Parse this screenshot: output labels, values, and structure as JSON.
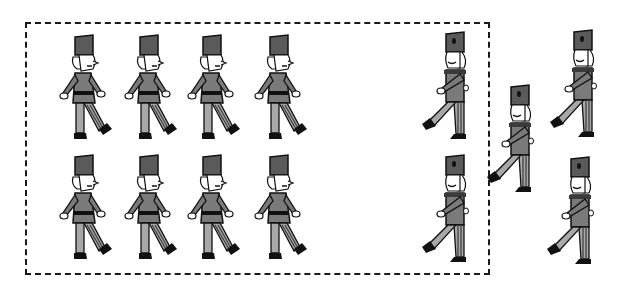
{
  "scene": {
    "description": "Toy soldiers marching; eight grouped inside a dashed rectangle facing right, two inside on the right facing left, three outside the box facing left",
    "colors": {
      "hat": "#5a5a5a",
      "coat": "#7a7a7a",
      "trousers": "#a8a8a8",
      "stripe": "#3a3a3a",
      "skin": "#ffffff",
      "outline": "#111111",
      "boot": "#111111"
    },
    "box": {
      "x": 25,
      "y": 22,
      "width": 465,
      "height": 253,
      "style": "dashed"
    },
    "soldiers": [
      {
        "id": "s1",
        "x": 57,
        "y": 33,
        "facing": "right",
        "in_box": true
      },
      {
        "id": "s2",
        "x": 122,
        "y": 33,
        "facing": "right",
        "in_box": true
      },
      {
        "id": "s3",
        "x": 185,
        "y": 33,
        "facing": "right",
        "in_box": true
      },
      {
        "id": "s4",
        "x": 252,
        "y": 33,
        "facing": "right",
        "in_box": true
      },
      {
        "id": "s5",
        "x": 57,
        "y": 153,
        "facing": "right",
        "in_box": true
      },
      {
        "id": "s6",
        "x": 122,
        "y": 153,
        "facing": "right",
        "in_box": true
      },
      {
        "id": "s7",
        "x": 185,
        "y": 153,
        "facing": "right",
        "in_box": true
      },
      {
        "id": "s8",
        "x": 252,
        "y": 153,
        "facing": "right",
        "in_box": true
      },
      {
        "id": "s9",
        "x": 420,
        "y": 30,
        "facing": "left",
        "in_box": true
      },
      {
        "id": "s10",
        "x": 420,
        "y": 153,
        "facing": "left",
        "in_box": true
      },
      {
        "id": "s11",
        "x": 485,
        "y": 83,
        "facing": "left",
        "in_box": false
      },
      {
        "id": "s12",
        "x": 548,
        "y": 28,
        "facing": "left",
        "in_box": false
      },
      {
        "id": "s13",
        "x": 545,
        "y": 155,
        "facing": "left",
        "in_box": false
      }
    ],
    "counts": {
      "inside_box": 10,
      "outside_box": 3,
      "total": 13
    }
  }
}
